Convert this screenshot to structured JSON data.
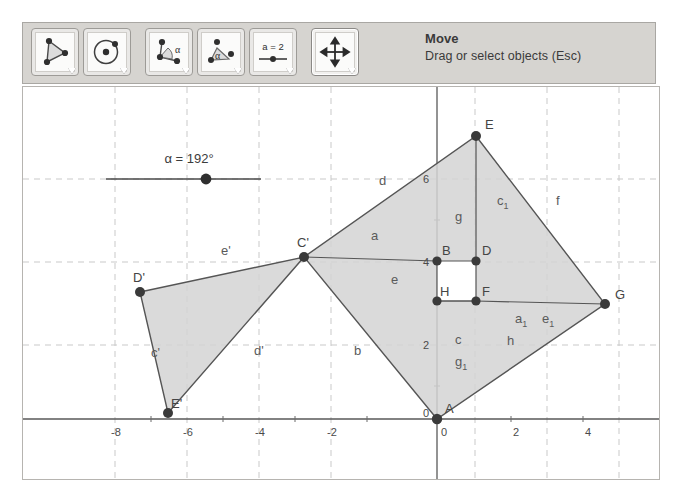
{
  "app": {
    "name": "GeoGebra Geometry View"
  },
  "toolbar": {
    "tools": [
      {
        "icon": "polygon-icon",
        "name": "polygon-tool",
        "selected": false
      },
      {
        "icon": "circle-center-point-icon",
        "name": "circle-tool",
        "selected": false
      },
      {
        "icon": "angle-icon",
        "name": "angle-tool",
        "selected": false
      },
      {
        "icon": "angle-fixed-size-icon",
        "name": "angle-fixed-tool",
        "selected": false
      },
      {
        "icon": "slider-icon",
        "name": "slider-tool",
        "selected": false,
        "icon_text": "a = 2"
      },
      {
        "icon": "move-arrows-icon",
        "name": "move-tool",
        "selected": true
      }
    ],
    "status_title": "Move",
    "status_subtitle": "Drag or select objects (Esc)"
  },
  "slider": {
    "label": "α = 192°",
    "variable": "α",
    "value": 192,
    "unit": "°"
  },
  "axes": {
    "x_ticks": [
      "-8",
      "-6",
      "-4",
      "-2",
      "0",
      "2",
      "4"
    ],
    "y_ticks": [
      "6",
      "4",
      "2",
      "0"
    ],
    "origin_label": "0",
    "grid": true
  },
  "points": [
    {
      "label": "E",
      "x": 475,
      "y": 135
    },
    {
      "label": "C'",
      "x": 303,
      "y": 256
    },
    {
      "label": "D'",
      "x": 139,
      "y": 291
    },
    {
      "label": "E'",
      "x": 167,
      "y": 412
    },
    {
      "label": "A",
      "x": 436,
      "y": 418
    },
    {
      "label": "G",
      "x": 604,
      "y": 303
    },
    {
      "label": "B",
      "x": 436,
      "y": 260
    },
    {
      "label": "D",
      "x": 475,
      "y": 260
    },
    {
      "label": "H",
      "x": 436,
      "y": 300
    },
    {
      "label": "F",
      "x": 475,
      "y": 300
    }
  ],
  "segment_labels": [
    {
      "text": "d",
      "x": 380,
      "y": 180
    },
    {
      "text": "c",
      "sub": "1",
      "x": 500,
      "y": 200
    },
    {
      "text": "f",
      "x": 557,
      "y": 200
    },
    {
      "text": "g",
      "x": 456,
      "y": 218
    },
    {
      "text": "a",
      "x": 372,
      "y": 237
    },
    {
      "text": "e",
      "x": 392,
      "y": 281
    },
    {
      "text": "e'",
      "x": 222,
      "y": 252
    },
    {
      "text": "c'",
      "x": 152,
      "y": 354
    },
    {
      "text": "d'",
      "x": 255,
      "y": 352
    },
    {
      "text": "b",
      "x": 355,
      "y": 352
    },
    {
      "text": "c",
      "x": 456,
      "y": 341
    },
    {
      "text": "h",
      "x": 508,
      "y": 342
    },
    {
      "text": "g",
      "sub": "1",
      "x": 456,
      "y": 363
    },
    {
      "text": "a",
      "sub": "1",
      "x": 516,
      "y": 320
    },
    {
      "text": "e",
      "sub": "1",
      "x": 543,
      "y": 320
    }
  ],
  "colors": {
    "panel_bg": "#d6d4d0",
    "panel_border": "#a9a7a3",
    "view_bg": "#ffffff",
    "polygon_fill": "#d3d3d3",
    "polygon_stroke": "#555555",
    "point_fill": "#3a3a3a",
    "axis": "#595959",
    "grid": "#c9c9c9"
  }
}
